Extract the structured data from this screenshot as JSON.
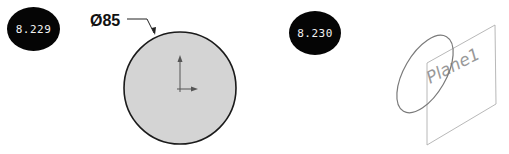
{
  "figures": [
    {
      "id": "8.229",
      "label": "8.229",
      "dimension": {
        "symbol": "Ø",
        "value": "85",
        "text": "Ø85"
      },
      "shape": "circle"
    },
    {
      "id": "8.230",
      "label": "8.230",
      "plane_label": "Plane1",
      "shape": "circle-on-plane-isometric"
    }
  ],
  "colors": {
    "badge_bg": "#050505",
    "badge_text": "#f2f2f2",
    "circle_fill": "#d4d4d4",
    "circle_stroke": "#1a1a1a",
    "plane_stroke": "#a8a8a8",
    "sketch_stroke": "#7a7a7a"
  }
}
